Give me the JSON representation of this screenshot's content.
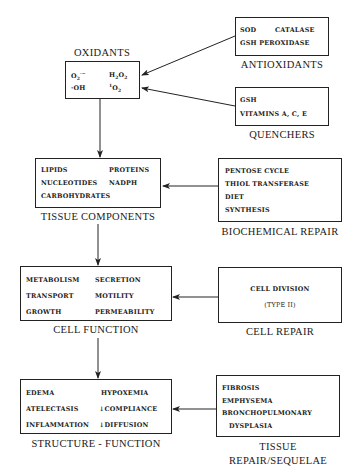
{
  "diagram": {
    "oxidants": {
      "title": "OXIDANTS",
      "items": [
        "O2·−",
        "H2O2",
        "·OH",
        "1O2"
      ]
    },
    "antioxidants": {
      "title": "ANTIOXIDANTS",
      "items": [
        "SOD",
        "CATALASE",
        "GSH PEROXIDASE"
      ]
    },
    "quenchers": {
      "title": "QUENCHERS",
      "items": [
        "GSH",
        "VITAMINS A, C, E"
      ]
    },
    "tissue_components": {
      "title": "TISSUE COMPONENTS",
      "items": [
        "LIPIDS",
        "PROTEINS",
        "NUCLEOTIDES",
        "NADPH",
        "CARBOHYDRATES"
      ]
    },
    "biochemical_repair": {
      "title": "BIOCHEMICAL REPAIR",
      "items": [
        "PENTOSE CYCLE",
        "THIOL TRANSFERASE",
        "DIET",
        "SYNTHESIS"
      ]
    },
    "cell_function": {
      "title": "CELL FUNCTION",
      "items": [
        "METABOLISM",
        "SECRETION",
        "TRANSPORT",
        "MOTILITY",
        "GROWTH",
        "PERMEABILITY"
      ]
    },
    "cell_repair": {
      "title": "CELL REPAIR",
      "items": [
        "CELL DIVISION",
        "(TYPE II)"
      ]
    },
    "structure_function": {
      "title": "STRUCTURE - FUNCTION",
      "items": [
        "EDEMA",
        "HYPOXEMIA",
        "ATELECTASIS",
        "↓COMPLIANCE",
        "INFLAMMATION",
        "↓DIFFUSION"
      ]
    },
    "tissue_repair": {
      "title_line1": "TISSUE",
      "title_line2": "REPAIR/SEQUELAE",
      "items": [
        "FIBROSIS",
        "EMPHYSEMA",
        "BRONCHOPULMONARY",
        "DYSPLASIA"
      ]
    },
    "colors": {
      "line": "#222222",
      "text": "#1a1a1a",
      "background": "#ffffff"
    }
  }
}
